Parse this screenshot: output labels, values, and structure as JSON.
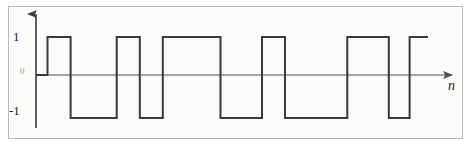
{
  "figure": {
    "background_color": "#fbfbfa",
    "border_color": "#b9b9b9",
    "signal_color": "#3a3a3a",
    "axis_color": "#4a4a4a"
  },
  "axes": {
    "y_label_top": "1",
    "y_label_bottom": "-1",
    "y_label_zero": "0",
    "x_label": "n",
    "x_arrow": "arrow-right",
    "y_arrow": "arrow-up"
  },
  "chart_data": {
    "type": "line",
    "title": "",
    "subtitle": "",
    "xlabel": "n",
    "ylabel": "",
    "grid": false,
    "legend": null,
    "step_style": "post",
    "ylim": [
      -1.6,
      1.6
    ],
    "yticks": [
      1,
      0,
      -1
    ],
    "ytick_labels": [
      "1",
      "0",
      "-1"
    ],
    "xlim": [
      0,
      12
    ],
    "xticks": [],
    "xtick_labels": [],
    "series": [
      {
        "name": "bipolar-nrz-signal",
        "x": [
          0,
          0.5,
          0.5,
          1.5,
          1.5,
          3.5,
          3.5,
          4.5,
          4.5,
          5.5,
          5.5,
          8.0,
          8.0,
          9.8,
          9.8,
          10.8,
          10.8,
          13.5,
          13.5,
          15.3,
          15.3,
          16.2,
          16.2,
          17.0
        ],
        "y": [
          0,
          0,
          1,
          1,
          -1,
          -1,
          1,
          1,
          -1,
          -1,
          1,
          1,
          -1,
          -1,
          1,
          1,
          -1,
          -1,
          1,
          1,
          -1,
          -1,
          1,
          1
        ]
      }
    ],
    "levels": [
      {
        "level": 0,
        "x_start": 0.0,
        "x_end": 0.5
      },
      {
        "level": 1,
        "x_start": 0.5,
        "x_end": 1.5
      },
      {
        "level": -1,
        "x_start": 1.5,
        "x_end": 3.5
      },
      {
        "level": 1,
        "x_start": 3.5,
        "x_end": 4.5
      },
      {
        "level": -1,
        "x_start": 4.5,
        "x_end": 5.5
      },
      {
        "level": 1,
        "x_start": 5.5,
        "x_end": 8.0
      },
      {
        "level": -1,
        "x_start": 8.0,
        "x_end": 9.8
      },
      {
        "level": 1,
        "x_start": 9.8,
        "x_end": 10.8
      },
      {
        "level": -1,
        "x_start": 10.8,
        "x_end": 13.5
      },
      {
        "level": 1,
        "x_start": 13.5,
        "x_end": 15.3
      },
      {
        "level": -1,
        "x_start": 15.3,
        "x_end": 16.2
      },
      {
        "level": 1,
        "x_start": 16.2,
        "x_end": 17.0
      }
    ],
    "bit_sequence": [
      1,
      -1,
      1,
      -1,
      1,
      -1,
      1,
      -1,
      1,
      -1,
      1
    ]
  }
}
